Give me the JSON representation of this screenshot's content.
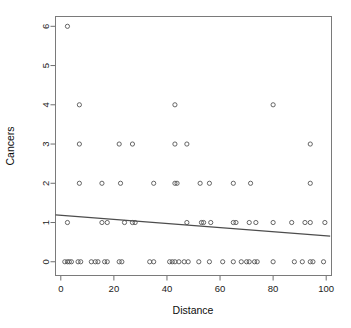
{
  "chart_data": {
    "type": "scatter",
    "title": "",
    "xlabel": "Distance",
    "ylabel": "Cancers",
    "xlim": [
      -2,
      102
    ],
    "ylim": [
      -0.35,
      6.25
    ],
    "xticks": [
      0,
      20,
      40,
      60,
      80,
      100
    ],
    "yticks": [
      0,
      1,
      2,
      3,
      4,
      5,
      6
    ],
    "xtick_labels": [
      "0",
      "20",
      "40",
      "60",
      "80",
      "100"
    ],
    "ytick_labels": [
      "0",
      "1",
      "2",
      "3",
      "4",
      "5",
      "6"
    ],
    "grid": false,
    "legend": false,
    "marker": "open-circle",
    "points": [
      {
        "x": 2.5,
        "y": 6
      },
      {
        "x": 7,
        "y": 4
      },
      {
        "x": 43,
        "y": 4
      },
      {
        "x": 80,
        "y": 4
      },
      {
        "x": 7,
        "y": 3
      },
      {
        "x": 22,
        "y": 3
      },
      {
        "x": 27,
        "y": 3
      },
      {
        "x": 43,
        "y": 3
      },
      {
        "x": 47.5,
        "y": 3
      },
      {
        "x": 94,
        "y": 3
      },
      {
        "x": 7,
        "y": 2
      },
      {
        "x": 15.5,
        "y": 2
      },
      {
        "x": 22.5,
        "y": 2
      },
      {
        "x": 35,
        "y": 2
      },
      {
        "x": 43,
        "y": 2
      },
      {
        "x": 43.8,
        "y": 2
      },
      {
        "x": 52.5,
        "y": 2
      },
      {
        "x": 56,
        "y": 2
      },
      {
        "x": 65,
        "y": 2
      },
      {
        "x": 71.5,
        "y": 2
      },
      {
        "x": 94,
        "y": 2
      },
      {
        "x": 2.5,
        "y": 1
      },
      {
        "x": 15.5,
        "y": 1
      },
      {
        "x": 17.5,
        "y": 1
      },
      {
        "x": 24,
        "y": 1
      },
      {
        "x": 27,
        "y": 1
      },
      {
        "x": 28,
        "y": 1
      },
      {
        "x": 47.5,
        "y": 1
      },
      {
        "x": 53,
        "y": 1
      },
      {
        "x": 53.8,
        "y": 1
      },
      {
        "x": 56.5,
        "y": 1
      },
      {
        "x": 65,
        "y": 1
      },
      {
        "x": 66,
        "y": 1
      },
      {
        "x": 71,
        "y": 1
      },
      {
        "x": 73.5,
        "y": 1
      },
      {
        "x": 80,
        "y": 1
      },
      {
        "x": 87,
        "y": 1
      },
      {
        "x": 92,
        "y": 1
      },
      {
        "x": 94,
        "y": 1
      },
      {
        "x": 99.5,
        "y": 1
      },
      {
        "x": 1.5,
        "y": 0
      },
      {
        "x": 2.5,
        "y": 0
      },
      {
        "x": 3.2,
        "y": 0
      },
      {
        "x": 4,
        "y": 0
      },
      {
        "x": 6.5,
        "y": 0
      },
      {
        "x": 7.5,
        "y": 0
      },
      {
        "x": 11.5,
        "y": 0
      },
      {
        "x": 13,
        "y": 0
      },
      {
        "x": 14,
        "y": 0
      },
      {
        "x": 16.5,
        "y": 0
      },
      {
        "x": 17.5,
        "y": 0
      },
      {
        "x": 22,
        "y": 0
      },
      {
        "x": 23,
        "y": 0
      },
      {
        "x": 33.5,
        "y": 0
      },
      {
        "x": 35,
        "y": 0
      },
      {
        "x": 41,
        "y": 0
      },
      {
        "x": 42,
        "y": 0
      },
      {
        "x": 43,
        "y": 0
      },
      {
        "x": 44.5,
        "y": 0
      },
      {
        "x": 46.5,
        "y": 0
      },
      {
        "x": 48,
        "y": 0
      },
      {
        "x": 52,
        "y": 0
      },
      {
        "x": 56,
        "y": 0
      },
      {
        "x": 61,
        "y": 0
      },
      {
        "x": 65,
        "y": 0
      },
      {
        "x": 68,
        "y": 0
      },
      {
        "x": 70,
        "y": 0
      },
      {
        "x": 71,
        "y": 0
      },
      {
        "x": 73,
        "y": 0
      },
      {
        "x": 74,
        "y": 0
      },
      {
        "x": 80,
        "y": 0
      },
      {
        "x": 88,
        "y": 0
      },
      {
        "x": 91,
        "y": 0
      },
      {
        "x": 94,
        "y": 0
      },
      {
        "x": 95,
        "y": 0
      },
      {
        "x": 99,
        "y": 0
      }
    ],
    "fit_line": {
      "x0": -2,
      "y0": 1.195,
      "x1": 101.5,
      "y1": 0.655,
      "slope": -0.00522,
      "intercept": 1.184
    }
  }
}
